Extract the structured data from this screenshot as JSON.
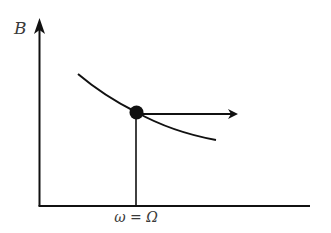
{
  "diagram": {
    "y_axis_label": "B",
    "x_tick_label": "ω = Ω",
    "colors": {
      "stroke": "#111111",
      "label": "#3a3a3a",
      "background": "#ffffff"
    },
    "elements": [
      "vertical y-axis with arrowhead labeled B",
      "horizontal x-axis",
      "decreasing curve",
      "filled point on curve",
      "vertical drop line from point to x-axis at ω = Ω",
      "horizontal arrow pointing right from point"
    ]
  }
}
